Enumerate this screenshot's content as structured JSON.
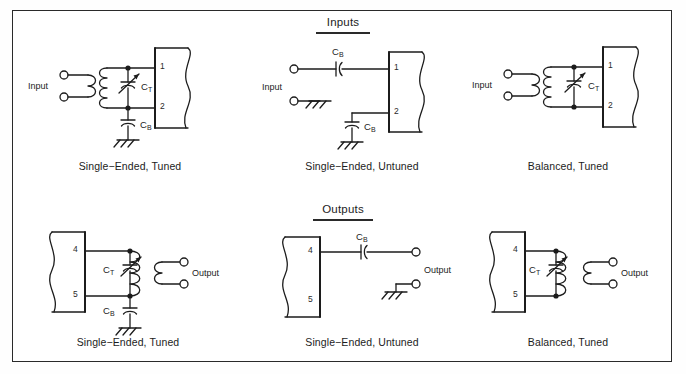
{
  "figure": {
    "type": "schematic-diagram",
    "title_visible": false,
    "border_color": "#2a2a2a",
    "line_color": "#1c1c1c",
    "background": "#ffffff"
  },
  "sections": {
    "inputs": {
      "heading": "Inputs"
    },
    "outputs": {
      "heading": "Outputs"
    }
  },
  "labels": {
    "input": "Input",
    "output": "Output",
    "ct": "C",
    "ct_sub": "T",
    "cb": "C",
    "cb_sub": "B"
  },
  "circuits": [
    {
      "id": "input-single-ended-tuned",
      "row": "inputs",
      "caption": "Single−Ended,  Tuned",
      "port_label": "Input",
      "pins": [
        "1",
        "2"
      ],
      "components": [
        "transformer",
        "variable-capacitor-CT",
        "bypass-capacitor-CB",
        "ground"
      ],
      "cap_tuning": "C",
      "cap_tuning_sub": "T",
      "cap_bypass": "C",
      "cap_bypass_sub": "B"
    },
    {
      "id": "input-single-ended-untuned",
      "row": "inputs",
      "caption": "Single−Ended,  Untuned",
      "port_label": "Input",
      "pins": [
        "1",
        "2"
      ],
      "components": [
        "series-capacitor-CB",
        "bypass-capacitor-CB",
        "ground"
      ],
      "cap_series": "C",
      "cap_series_sub": "B",
      "cap_bypass": "C",
      "cap_bypass_sub": "B"
    },
    {
      "id": "input-balanced-tuned",
      "row": "inputs",
      "caption": "Balanced,  Tuned",
      "port_label": "Input",
      "pins": [
        "1",
        "2"
      ],
      "components": [
        "transformer",
        "variable-capacitor-CT"
      ],
      "cap_tuning": "C",
      "cap_tuning_sub": "T"
    },
    {
      "id": "output-single-ended-tuned",
      "row": "outputs",
      "caption": "Single−Ended,  Tuned",
      "port_label": "Output",
      "pins": [
        "4",
        "5"
      ],
      "components": [
        "transformer",
        "variable-capacitor-CT",
        "bypass-capacitor-CB",
        "ground"
      ],
      "cap_tuning": "C",
      "cap_tuning_sub": "T",
      "cap_bypass": "C",
      "cap_bypass_sub": "B"
    },
    {
      "id": "output-single-ended-untuned",
      "row": "outputs",
      "caption": "Single−Ended,  Untuned",
      "port_label": "Output",
      "pins": [
        "4",
        "5"
      ],
      "components": [
        "series-capacitor-CB",
        "ground"
      ],
      "cap_series": "C",
      "cap_series_sub": "B"
    },
    {
      "id": "output-balanced-tuned",
      "row": "outputs",
      "caption": "Balanced,  Tuned",
      "port_label": "Output",
      "pins": [
        "4",
        "5"
      ],
      "components": [
        "transformer",
        "variable-capacitor-CT"
      ],
      "cap_tuning": "C",
      "cap_tuning_sub": "T"
    }
  ]
}
